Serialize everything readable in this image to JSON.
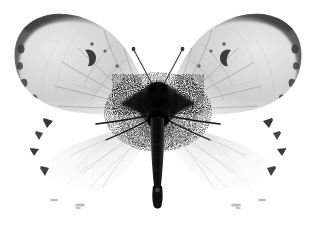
{
  "image": {
    "kind": "radiograph",
    "subject": "butterfly",
    "view": "dorsal-spread",
    "width": 316,
    "height": 231,
    "background_color": "#ffffff",
    "caption": "X-ray radiograph of a spread butterfly specimen",
    "palette": {
      "background": "#ffffff",
      "wing_light": "#f2f2f2",
      "wing_mid": "#d2d2d2",
      "wing_dark": "#b2b2b2",
      "apex_dark": "#4a4a4a",
      "apex_darkest": "#2e2e2e",
      "body_dark": "#1a1a1a",
      "body_black": "#050505",
      "vein": "#7a7a7a",
      "hindwing_faint": "#ededed",
      "spot": "#3a3a3a"
    }
  },
  "anatomy": {
    "parts": [
      {
        "name": "left-forewing",
        "label": "Left forewing",
        "bbox": [
          14,
          14,
          138,
          102
        ],
        "tone": "light-gray-gradient",
        "notes": "dark gray apex band, radiating veins, marginal spots"
      },
      {
        "name": "right-forewing",
        "label": "Right forewing",
        "bbox": [
          164,
          14,
          138,
          102
        ],
        "tone": "light-gray-gradient",
        "notes": "mirror of left forewing"
      },
      {
        "name": "left-hindwing",
        "label": "Left hindwing",
        "bbox": [
          28,
          112,
          125,
          92
        ],
        "tone": "near-transparent",
        "notes": "faint translucent membrane with small dark marginal triangles"
      },
      {
        "name": "right-hindwing",
        "label": "Right hindwing",
        "bbox": [
          163,
          112,
          125,
          92
        ],
        "tone": "near-transparent",
        "notes": "mirror of left hindwing"
      },
      {
        "name": "thorax",
        "label": "Thorax",
        "bbox": [
          140,
          84,
          36,
          40
        ],
        "tone": "dense-black",
        "notes": "highest radiographic density, speckled scale scatter"
      },
      {
        "name": "abdomen",
        "label": "Abdomen",
        "bbox": [
          150,
          118,
          16,
          92
        ],
        "tone": "dense-black",
        "notes": "tapering dark shaft ending in rounded tip"
      },
      {
        "name": "head",
        "label": "Head",
        "bbox": [
          152,
          78,
          12,
          12
        ],
        "tone": "dark"
      },
      {
        "name": "left-antenna",
        "label": "Left antenna",
        "points": [
          [
            153,
            84
          ],
          [
            138,
            58
          ],
          [
            134,
            50
          ]
        ],
        "tone": "thin-gray-line"
      },
      {
        "name": "right-antenna",
        "label": "Right antenna",
        "points": [
          [
            163,
            84
          ],
          [
            178,
            58
          ],
          [
            182,
            50
          ]
        ],
        "tone": "thin-gray-line"
      }
    ],
    "marginal_spot_counts": {
      "forewing_outer_margin_each_side": 4,
      "hindwing_margin_triangles_each_side": 4
    }
  }
}
